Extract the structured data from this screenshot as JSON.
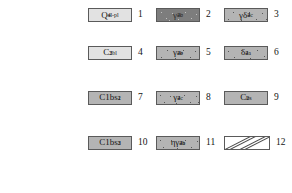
{
  "figure": {
    "kind": "map-legend",
    "background_color": "#ffffff",
    "columns": 3,
    "rows": 4,
    "total_entries": 12
  },
  "palette": {
    "fill_light": "#e2e2e2",
    "fill_mid": "#b4b4b4",
    "fill_dark": "#7d7d7d",
    "fill_white": "#ffffff",
    "border": "#5a5a5a",
    "text": "#141414",
    "hatch_line": "#4a4a4a"
  },
  "entries": [
    {
      "number": "1",
      "fill": "light",
      "pattern": "plain",
      "symbol_plain": "Q4 al-pl",
      "symbol_base": "Q",
      "symbol_sub": "4",
      "symbol_sup": "al-pl"
    },
    {
      "number": "2",
      "fill": "dark",
      "pattern": "stipple",
      "symbol_plain": "γ 2b 4c",
      "symbol_base": "γ",
      "symbol_sub": "4c",
      "symbol_sup": "2b"
    },
    {
      "number": "3",
      "fill": "mid",
      "pattern": "stipple",
      "symbol_plain": "γδ 2 4c",
      "symbol_base": "γδ",
      "symbol_sub": "4c",
      "symbol_sup": "2"
    },
    {
      "number": "4",
      "fill": "light",
      "pattern": "plain",
      "symbol_plain": "C 2bl 3",
      "symbol_base": "C",
      "symbol_sub": "2bl",
      "symbol_sup": "3"
    },
    {
      "number": "5",
      "fill": "mid",
      "pattern": "stipple",
      "symbol_plain": "γ 2b 4e",
      "symbol_base": "γ",
      "symbol_sub": "4e",
      "symbol_sup": "2b"
    },
    {
      "number": "6",
      "fill": "mid",
      "pattern": "stipple",
      "symbol_plain": "δ 2 4a",
      "symbol_base": "δ",
      "symbol_sub": "4a",
      "symbol_sup": "2"
    },
    {
      "number": "7",
      "fill": "mid",
      "pattern": "plain",
      "symbol_plain": "C1bs 2 1",
      "symbol_base": "C1bs",
      "symbol_sub": "2",
      "symbol_sup": "1"
    },
    {
      "number": "8",
      "fill": "mid",
      "pattern": "stipple",
      "symbol_plain": "γ 2 4c",
      "symbol_base": "γ",
      "symbol_sub": "4c",
      "symbol_sup": "2"
    },
    {
      "number": "9",
      "fill": "mid",
      "pattern": "plain",
      "symbol_plain": "C 2 bs",
      "symbol_base": "C",
      "symbol_sub": "2",
      "symbol_sup": "bs"
    },
    {
      "number": "10",
      "fill": "mid",
      "pattern": "plain",
      "symbol_plain": "C1bs 2 3",
      "symbol_base": "C1bs",
      "symbol_sub": "2",
      "symbol_sup": "3"
    },
    {
      "number": "11",
      "fill": "mid",
      "pattern": "stipple",
      "symbol_plain": "ηγ 2b 4a",
      "symbol_base": "ηγ",
      "symbol_sub": "4a",
      "symbol_sup": "2b"
    },
    {
      "number": "12",
      "fill": "white",
      "pattern": "diagonal-hatch",
      "symbol_plain": "",
      "symbol_base": "",
      "symbol_sub": "",
      "symbol_sup": ""
    }
  ]
}
